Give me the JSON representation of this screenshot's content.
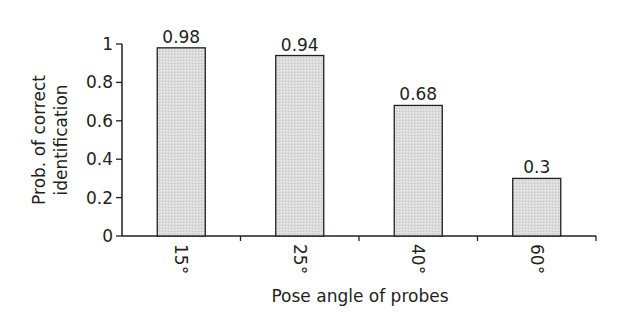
{
  "chart_data": {
    "type": "bar",
    "title": "",
    "xlabel": "Pose angle of probes",
    "ylabel": "Prob. of correct identification",
    "ylabel_lines": [
      "Prob. of correct",
      "identification"
    ],
    "categories": [
      "15°",
      "25°",
      "40°",
      "60°"
    ],
    "values": [
      0.98,
      0.94,
      0.68,
      0.3
    ],
    "value_labels": [
      "0.98",
      "0.94",
      "0.68",
      "0.3"
    ],
    "ylim": [
      0,
      1
    ],
    "yticks": [
      0,
      0.2,
      0.4,
      0.6,
      0.8,
      1
    ],
    "ytick_labels": [
      "0",
      "0.2",
      "0.4",
      "0.6",
      "0.8",
      "1"
    ],
    "grid": false,
    "legend": null,
    "bar_fill": "#d9d9d9",
    "bar_stroke": "#231f20"
  }
}
